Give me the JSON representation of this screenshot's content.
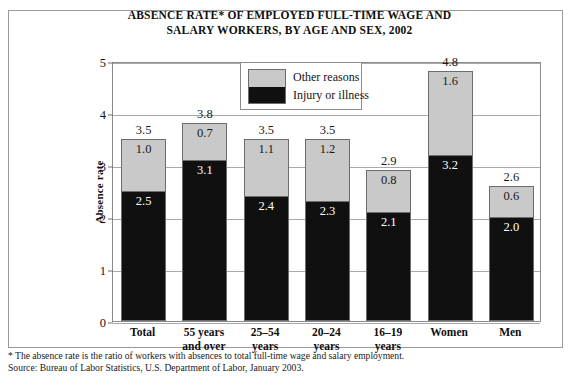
{
  "title": {
    "line1": "ABSENCE RATE* OF EMPLOYED FULL-TIME WAGE AND",
    "line2": "SALARY WORKERS, BY AGE AND SEX, 2002"
  },
  "legend": {
    "other_label": "Other reasons",
    "injury_label": "Injury or illness"
  },
  "footnotes": {
    "note": "* The absence rate is the ratio of workers with absences to total full-time wage and salary employment.",
    "source": "Source: Bureau of Labor Statistics, U.S. Department of Labor, January 2003."
  },
  "colors": {
    "other": "#c9c9c9",
    "injury": "#101010",
    "frame": "#8c8c8c",
    "gridline": "#a9a9a9"
  },
  "chart_data": {
    "type": "bar",
    "subtype": "stacked-vertical",
    "title": "ABSENCE RATE* OF EMPLOYED FULL-TIME WAGE AND SALARY WORKERS, BY AGE AND SEX, 2002",
    "xlabel": "",
    "ylabel": "Absence rate",
    "ylim": [
      0,
      5
    ],
    "yticks": [
      0,
      1,
      2,
      3,
      4,
      5
    ],
    "ytick_labels": [
      "0",
      "1",
      "2",
      "3",
      "4",
      "5"
    ],
    "grid": true,
    "legend_position": "top-center-inside",
    "categories": [
      "Total",
      "55 years and over",
      "25–54 years",
      "20–24 years",
      "16–19 years",
      "Women",
      "Men"
    ],
    "category_lines": [
      [
        "Total"
      ],
      [
        "55 years",
        "and over"
      ],
      [
        "25–54",
        "years"
      ],
      [
        "20–24",
        "years"
      ],
      [
        "16–19",
        "years"
      ],
      [
        "Women"
      ],
      [
        "Men"
      ]
    ],
    "series": [
      {
        "name": "Injury or illness",
        "color": "#101010",
        "values": [
          2.5,
          3.1,
          2.4,
          2.3,
          2.1,
          3.2,
          2.0
        ]
      },
      {
        "name": "Other reasons",
        "color": "#c9c9c9",
        "values": [
          1.0,
          0.7,
          1.1,
          1.2,
          0.8,
          1.6,
          0.6
        ]
      }
    ],
    "totals": [
      3.5,
      3.8,
      3.5,
      3.5,
      2.9,
      4.8,
      2.6
    ],
    "total_labels": [
      "3.5",
      "3.8",
      "3.5",
      "3.5",
      "2.9",
      "4.8",
      "2.6"
    ],
    "injury_labels": [
      "2.5",
      "3.1",
      "2.4",
      "2.3",
      "2.1",
      "3.2",
      "2.0"
    ],
    "other_labels": [
      "1.0",
      "0.7",
      "1.1",
      "1.2",
      "0.8",
      "1.6",
      "0.6"
    ]
  }
}
